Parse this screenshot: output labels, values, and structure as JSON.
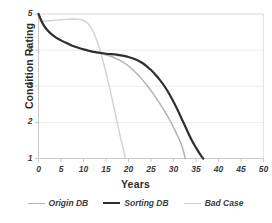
{
  "chart_data": {
    "type": "line",
    "title": "",
    "xlabel": "Years",
    "ylabel": "Condition Rating",
    "xlim": [
      0,
      50
    ],
    "ylim": [
      1,
      5
    ],
    "xticks": [
      0,
      5,
      10,
      15,
      20,
      25,
      30,
      35,
      40,
      45,
      50
    ],
    "yticks": [
      1,
      2,
      3,
      4,
      5
    ],
    "grid": "horizontal",
    "legend_position": "bottom",
    "series": [
      {
        "name": "Origin DB",
        "color": "#b0b0b0",
        "width": 1.4,
        "points": [
          [
            0,
            5.0
          ],
          [
            1,
            4.72
          ],
          [
            2,
            4.55
          ],
          [
            3,
            4.43
          ],
          [
            4,
            4.34
          ],
          [
            5,
            4.27
          ],
          [
            6,
            4.21
          ],
          [
            7,
            4.15
          ],
          [
            8,
            4.1
          ],
          [
            9,
            4.06
          ],
          [
            10,
            4.02
          ],
          [
            11,
            3.99
          ],
          [
            12,
            3.96
          ],
          [
            13,
            3.93
          ],
          [
            14,
            3.9
          ],
          [
            15,
            3.87
          ],
          [
            16,
            3.83
          ],
          [
            17,
            3.78
          ],
          [
            18,
            3.72
          ],
          [
            19,
            3.65
          ],
          [
            20,
            3.56
          ],
          [
            21,
            3.45
          ],
          [
            22,
            3.33
          ],
          [
            23,
            3.19
          ],
          [
            24,
            3.04
          ],
          [
            25,
            2.88
          ],
          [
            26,
            2.7
          ],
          [
            27,
            2.51
          ],
          [
            28,
            2.31
          ],
          [
            29,
            2.1
          ],
          [
            30,
            1.86
          ],
          [
            31,
            1.6
          ],
          [
            32,
            1.3
          ],
          [
            32.6,
            1.0
          ]
        ]
      },
      {
        "name": "Sorting DB",
        "color": "#2f2f2f",
        "width": 2.2,
        "points": [
          [
            0,
            5.0
          ],
          [
            1,
            4.72
          ],
          [
            2,
            4.55
          ],
          [
            3,
            4.43
          ],
          [
            4,
            4.34
          ],
          [
            5,
            4.27
          ],
          [
            6,
            4.21
          ],
          [
            7,
            4.15
          ],
          [
            8,
            4.1
          ],
          [
            9,
            4.06
          ],
          [
            10,
            4.02
          ],
          [
            11,
            3.99
          ],
          [
            12,
            3.96
          ],
          [
            13,
            3.94
          ],
          [
            14,
            3.92
          ],
          [
            15,
            3.9
          ],
          [
            16,
            3.89
          ],
          [
            17,
            3.88
          ],
          [
            18,
            3.86
          ],
          [
            19,
            3.84
          ],
          [
            20,
            3.81
          ],
          [
            21,
            3.77
          ],
          [
            22,
            3.72
          ],
          [
            23,
            3.65
          ],
          [
            24,
            3.56
          ],
          [
            25,
            3.45
          ],
          [
            26,
            3.32
          ],
          [
            27,
            3.17
          ],
          [
            28,
            3.0
          ],
          [
            29,
            2.8
          ],
          [
            30,
            2.57
          ],
          [
            31,
            2.32
          ],
          [
            32,
            2.05
          ],
          [
            33,
            1.78
          ],
          [
            34,
            1.52
          ],
          [
            35,
            1.3
          ],
          [
            36,
            1.1
          ],
          [
            36.6,
            1.0
          ]
        ]
      },
      {
        "name": "Bad Case",
        "color": "#d2d2d2",
        "width": 1.4,
        "points": [
          [
            0,
            4.8
          ],
          [
            1,
            4.8
          ],
          [
            2,
            4.81
          ],
          [
            3,
            4.82
          ],
          [
            4,
            4.83
          ],
          [
            5,
            4.84
          ],
          [
            6,
            4.85
          ],
          [
            7,
            4.86
          ],
          [
            8,
            4.86
          ],
          [
            9,
            4.85
          ],
          [
            10,
            4.82
          ],
          [
            11,
            4.73
          ],
          [
            12,
            4.55
          ],
          [
            13,
            4.25
          ],
          [
            14,
            3.85
          ],
          [
            15,
            3.38
          ],
          [
            16,
            2.85
          ],
          [
            17,
            2.28
          ],
          [
            18,
            1.7
          ],
          [
            19,
            1.18
          ],
          [
            19.3,
            1.0
          ]
        ]
      }
    ]
  },
  "axis": {
    "y_title": "Condition Rating",
    "x_title": "Years",
    "y_tick_labels": [
      "5",
      "4",
      "3",
      "2",
      "1"
    ],
    "x_tick_labels": [
      "0",
      "5",
      "10",
      "15",
      "20",
      "25",
      "30",
      "35",
      "40",
      "45",
      "50"
    ]
  },
  "legend": {
    "items": [
      {
        "label": "Origin DB",
        "color": "#b0b0b0",
        "width": 1.4
      },
      {
        "label": "Sorting DB",
        "color": "#2f2f2f",
        "width": 2.4
      },
      {
        "label": "Bad Case",
        "color": "#d2d2d2",
        "width": 1.4
      }
    ]
  },
  "colors": {
    "background": "#ffffff",
    "grid": "#ececec",
    "axis": "#c9c9c9",
    "text": "#333333"
  }
}
